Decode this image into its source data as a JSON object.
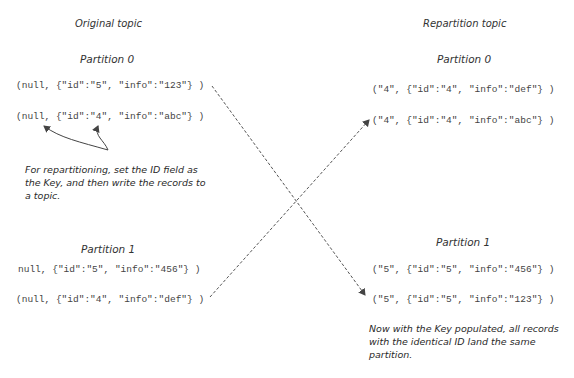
{
  "original_topic": {
    "title": "Original topic",
    "partitions": [
      {
        "label": "Partition 0",
        "records": [
          "(null, {\"id\":\"5\", \"info\":\"123\"} )",
          "(null, {\"id\":\"4\", \"info\":\"abc\"} )"
        ]
      },
      {
        "label": "Partition 1",
        "records": [
          "null, {\"id\":\"5\", \"info\":\"456\"} )",
          "(null, {\"id\":\"4\", \"info\":\"def\"} )"
        ]
      }
    ],
    "note": "For repartitioning, set the ID field as the Key, and then write the records to a topic."
  },
  "repartition_topic": {
    "title": "Repartition topic",
    "partitions": [
      {
        "label": "Partition 0",
        "records": [
          "(\"4\", {\"id\":\"4\", \"info\":\"def\"} )",
          "(\"4\", {\"id\":\"4\", \"info\":\"abc\"} )"
        ]
      },
      {
        "label": "Partition 1",
        "records": [
          "(\"5\", {\"id\":\"5\", \"info\":\"456\"} )",
          "(\"5\", {\"id\":\"5\", \"info\":\"123\"} )"
        ]
      }
    ],
    "note": "Now with the Key populated, all records with the identical ID land the same partition."
  },
  "colors": {
    "text": "#2a2a2a",
    "record_text": "#444444",
    "arrow": "#555555",
    "background": "#ffffff"
  }
}
